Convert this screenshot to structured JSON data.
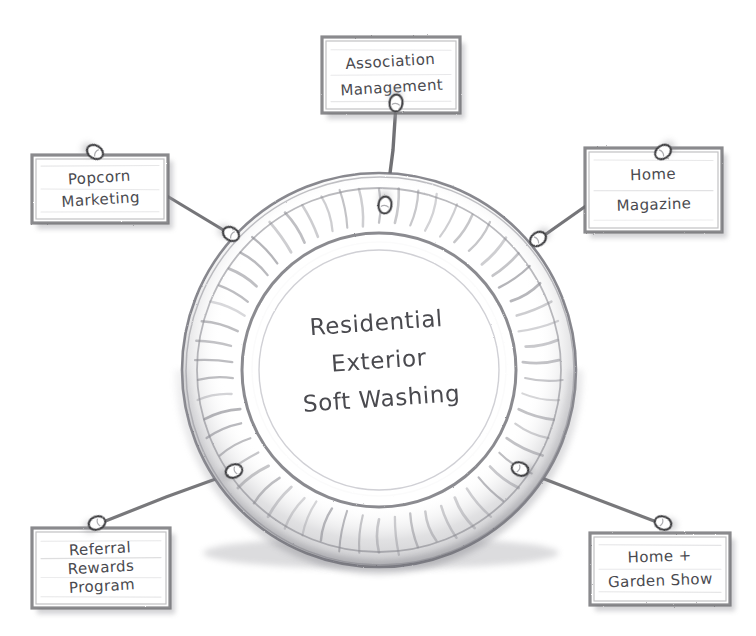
{
  "diagram": {
    "title": "Residential Exterior Soft Washing",
    "style": "hand-drawn pencil sketch concept map",
    "background_color": "#ffffff",
    "pencil_color": "#5e5e62",
    "text_color": "#4a4a4f",
    "shadow_color": "#9c9ca1"
  },
  "center": {
    "name": "center-plate",
    "label_lines": [
      "Residential",
      "Exterior",
      "Soft Washing"
    ],
    "cx": 379,
    "cy": 370,
    "outer_radius": 197,
    "inner_radius": 120,
    "scallop_count": 58
  },
  "nodes": [
    {
      "id": "association-management",
      "label_lines": [
        "Association",
        "Management"
      ],
      "x": 322,
      "y": 37,
      "w": 138,
      "h": 76,
      "pin_card": {
        "x": 396,
        "y": 103
      },
      "pin_plate": {
        "x": 385,
        "y": 205
      },
      "position": "top"
    },
    {
      "id": "popcorn-marketing",
      "label_lines": [
        "Popcorn",
        "Marketing"
      ],
      "x": 32,
      "y": 155,
      "w": 136,
      "h": 68,
      "pin_card": {
        "x": 95,
        "y": 152
      },
      "pin_plate": {
        "x": 231,
        "y": 234
      },
      "position": "upper-left"
    },
    {
      "id": "home-magazine",
      "label_lines": [
        "Home",
        "Magazine"
      ],
      "x": 585,
      "y": 148,
      "w": 137,
      "h": 84,
      "pin_card": {
        "x": 663,
        "y": 152
      },
      "pin_plate": {
        "x": 538,
        "y": 239
      },
      "position": "upper-right"
    },
    {
      "id": "referral-rewards-program",
      "label_lines": [
        "Referral",
        "Rewards",
        "Program"
      ],
      "x": 32,
      "y": 528,
      "w": 138,
      "h": 80,
      "pin_card": {
        "x": 97,
        "y": 523
      },
      "pin_plate": {
        "x": 234,
        "y": 471
      },
      "position": "lower-left"
    },
    {
      "id": "home-garden-show",
      "label_lines": [
        "Home +",
        "Garden Show"
      ],
      "x": 590,
      "y": 533,
      "w": 140,
      "h": 72,
      "pin_card": {
        "x": 663,
        "y": 523
      },
      "pin_plate": {
        "x": 520,
        "y": 469
      },
      "position": "lower-right"
    }
  ]
}
